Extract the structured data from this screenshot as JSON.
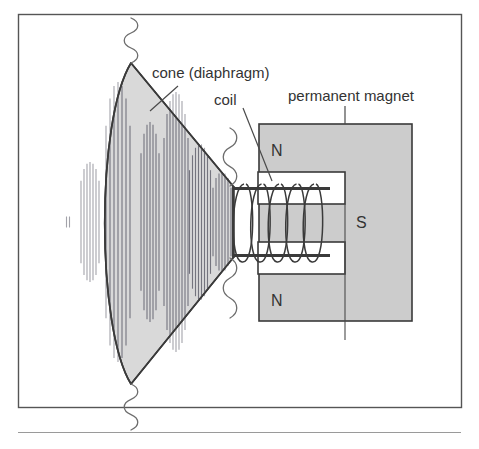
{
  "figure": {
    "kind": "loudspeaker-cross-section-diagram",
    "frame": {
      "border_color": "#555555",
      "background": "#ffffff"
    },
    "rule_below": {
      "color": "#8a8a8a"
    }
  },
  "labels": {
    "cone": "cone (diaphragm)",
    "coil": "coil",
    "permanent_magnet": "permanent magnet",
    "pole_north_top": "N",
    "pole_south_middle": "S",
    "pole_north_bottom": "N"
  },
  "colors": {
    "outline": "#3a3a3a",
    "cone_fill": "#d9d9d9",
    "magnet_fill": "#cccccc",
    "notch_fill": "#ffffff",
    "sound_wave": "#8d8d96",
    "squiggle": "#6d6d6d",
    "leader": "#4a4a4a",
    "text": "#333333"
  },
  "parts": {
    "cone": {
      "name": "cone (diaphragm)",
      "apex_top": [
        131,
        63
      ],
      "apex_bottom": [
        131,
        384
      ],
      "neck_top": [
        233,
        186
      ],
      "neck_bottom": [
        233,
        258
      ]
    },
    "voice_coil": {
      "name": "coil",
      "turns": 5,
      "former_left": 233,
      "former_right": 330
    },
    "magnet": {
      "name": "permanent magnet",
      "x": 259,
      "y": 124,
      "width": 153,
      "height": 197,
      "notch_top": {
        "x": 259,
        "y": 172,
        "width": 86,
        "height": 32
      },
      "notch_bottom": {
        "x": 259,
        "y": 242,
        "width": 86,
        "height": 32
      }
    },
    "sound_waves": {
      "description": "vertical hatch bands forming lens-shaped wavefronts radiating left from the cone",
      "bands": [
        {
          "cx": 68,
          "half_height": 6,
          "lines": 2,
          "spacing": 3
        },
        {
          "cx": 90,
          "half_height": 60,
          "lines": 7,
          "spacing": 3
        },
        {
          "cx": 118,
          "half_height": 140,
          "lines": 7,
          "spacing": 4
        },
        {
          "cx": 150,
          "half_height": 100,
          "lines": 7,
          "spacing": 3
        },
        {
          "cx": 176,
          "half_height": 130,
          "lines": 9,
          "spacing": 3
        },
        {
          "cx": 200,
          "half_height": 78,
          "lines": 8,
          "spacing": 3
        },
        {
          "cx": 222,
          "half_height": 50,
          "lines": 7,
          "spacing": 3
        }
      ]
    },
    "squiggles": [
      {
        "name": "squiggle-top-cone",
        "x": 131,
        "y_start": 18,
        "y_end": 63
      },
      {
        "name": "squiggle-bottom-cone",
        "x": 131,
        "y_start": 384,
        "y_end": 430
      },
      {
        "name": "squiggle-upper-neck",
        "x": 230,
        "y_start": 128,
        "y_end": 186
      },
      {
        "name": "squiggle-lower-neck",
        "x": 230,
        "y_start": 258,
        "y_end": 318
      }
    ],
    "leaders": [
      {
        "name": "leader-cone",
        "from": [
          176,
          86
        ],
        "to": [
          150,
          110
        ]
      },
      {
        "name": "leader-coil",
        "from": [
          240,
          108
        ],
        "to": [
          270,
          180
        ]
      },
      {
        "name": "leader-magnet",
        "from": [
          345,
          105
        ],
        "to": [
          345,
          124
        ]
      }
    ]
  }
}
